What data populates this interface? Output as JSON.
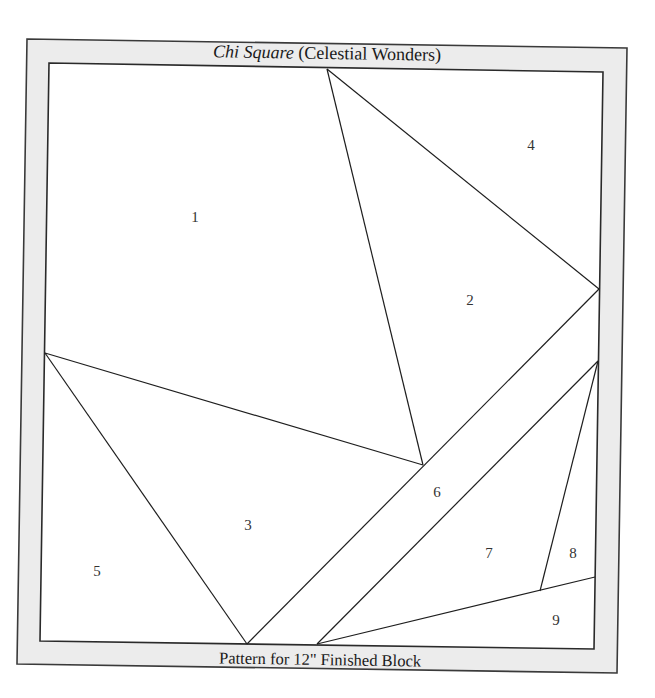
{
  "pattern": {
    "title_italic": "Chi Square",
    "title_rest": " (Celestial Wonders)",
    "footer": "Pattern for 12\" Finished Block"
  },
  "colors": {
    "frame_fill": "#ececec",
    "frame_stroke": "#3a3a3a",
    "line": "#1e1e1e",
    "block_fill": "#ffffff"
  },
  "pieces": [
    {
      "label": "1"
    },
    {
      "label": "2"
    },
    {
      "label": "3"
    },
    {
      "label": "4"
    },
    {
      "label": "5"
    },
    {
      "label": "6"
    },
    {
      "label": "7"
    },
    {
      "label": "8"
    },
    {
      "label": "9"
    }
  ]
}
